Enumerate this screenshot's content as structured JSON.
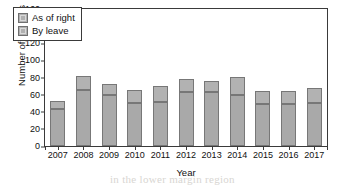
{
  "chart_data": {
    "type": "bar",
    "subtype": "stacked-vertical",
    "title": "",
    "xlabel": "Year",
    "ylabel": "Number of Appeals",
    "categories": [
      "2007",
      "2008",
      "2009",
      "2010",
      "2011",
      "2012",
      "2013",
      "2014",
      "2015",
      "2016",
      "2017"
    ],
    "series": [
      {
        "name": "By leave",
        "color": "#a9a9a9",
        "values": [
          43,
          66,
          60,
          50,
          51,
          63,
          63,
          59,
          49,
          49,
          50
        ]
      },
      {
        "name": "As of right",
        "color": "#b2b2b2",
        "values": [
          10,
          16,
          12,
          15,
          19,
          15,
          13,
          22,
          15,
          15,
          18
        ]
      }
    ],
    "totals": [
      53,
      82,
      72,
      65,
      70,
      78,
      76,
      81,
      64,
      64,
      68
    ],
    "ylim": [
      0,
      160
    ],
    "ytick_labels": [
      "0",
      "20",
      "40",
      "60",
      "80",
      "100",
      "120",
      "140",
      "160"
    ],
    "ytick_values": [
      0,
      20,
      40,
      60,
      80,
      100,
      120,
      140,
      160
    ],
    "grid": "off",
    "legend_position": "top-left",
    "legend_entries": [
      {
        "label": "As of right",
        "color": "#b2b2b2"
      },
      {
        "label": "By leave",
        "color": "#a9a9a9"
      }
    ]
  },
  "background_text": {
    "lines": [
      "the scanned page shows faint text",
      "and behind the chart ink bleed",
      "of the reverse side is visible",
      "across the upper white area",
      "in the lower margin region"
    ]
  }
}
